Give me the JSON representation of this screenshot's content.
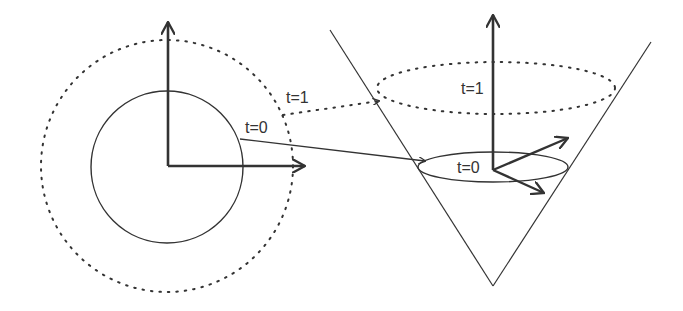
{
  "diagram": {
    "colors": {
      "stroke": "#333333",
      "background": "#ffffff"
    },
    "left_panel": {
      "labels": {
        "t0": "t=0",
        "t1": "t=1"
      },
      "shapes": {
        "solid_circle": "circle at t=0",
        "dotted_circle": "circle at t=1",
        "axes": [
          "vertical axis arrow",
          "horizontal axis arrow"
        ]
      }
    },
    "right_panel": {
      "labels": {
        "t0": "t=0",
        "t1": "t=1"
      },
      "shapes": {
        "cone": "light cone (V shape)",
        "solid_ellipse": "slice at t=0",
        "dotted_ellipse": "slice at t=1",
        "axes": [
          "time axis arrow",
          "spatial arrow up-right",
          "spatial arrow down-right"
        ]
      }
    },
    "mappings": [
      {
        "from": "left t=0 circle",
        "to": "right t=0 ellipse",
        "style": "solid"
      },
      {
        "from": "left t=1 circle",
        "to": "right t=1 ellipse",
        "style": "dotted"
      }
    ]
  }
}
